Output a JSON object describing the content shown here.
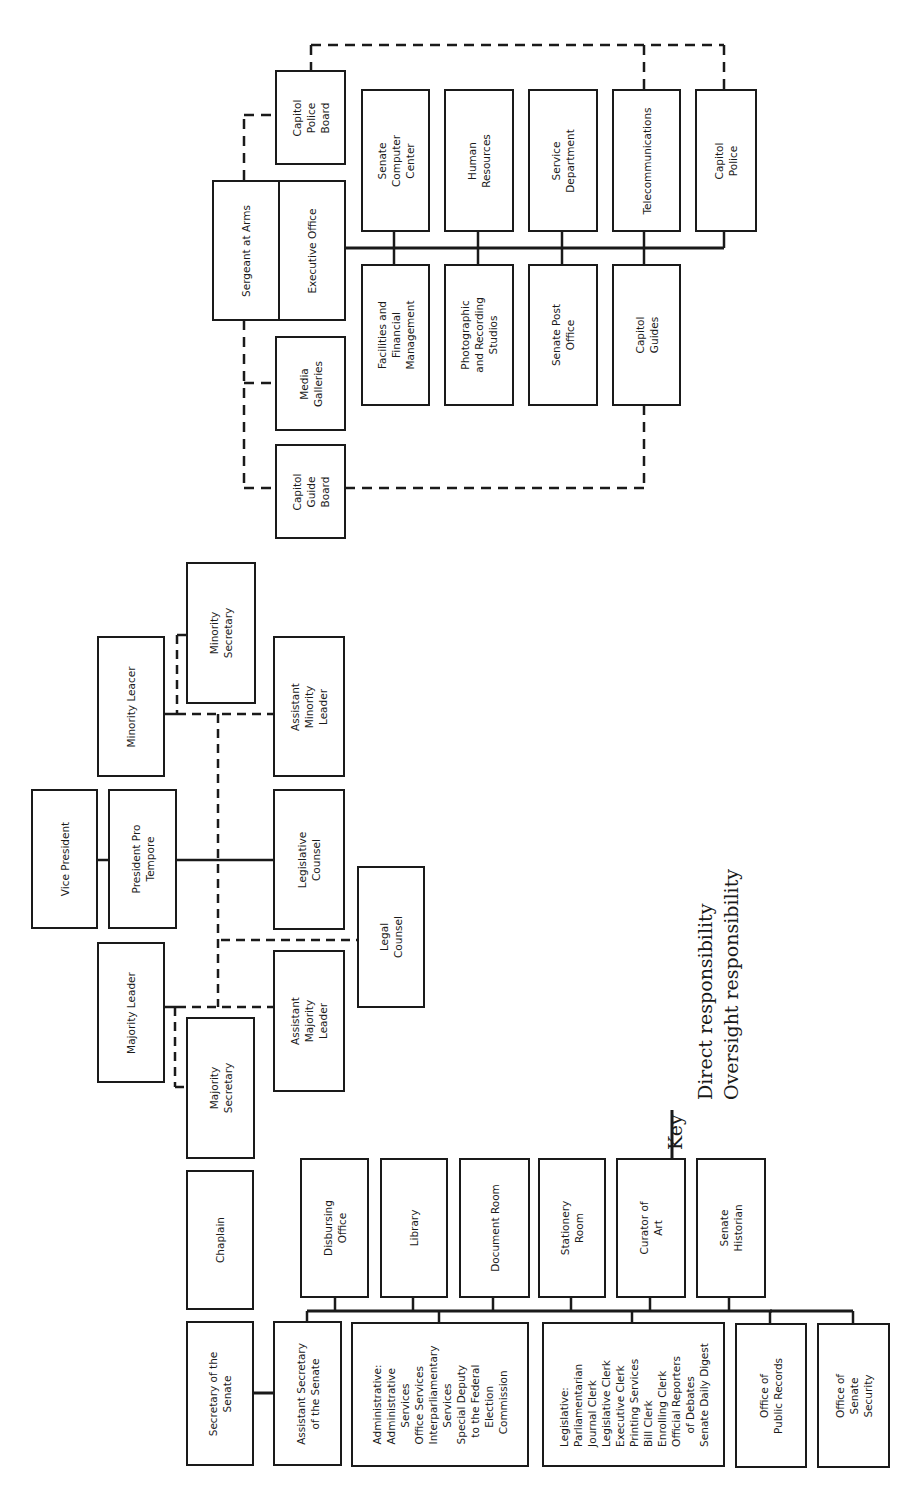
{
  "diagram": {
    "type": "org-chart",
    "orientation": "rotated-90-ccw",
    "title": "",
    "secretary_branch": {
      "head": "Secretary of the\nSenate",
      "chaplain": "Chaplain",
      "assistant": "Assistant Secretary\nof the Senate",
      "top_row": [
        "Disbursing\nOffice",
        "Library",
        "Document Room",
        "Stationery\nRoom",
        "Curator of\nArt",
        "Senate\nHistorian"
      ],
      "bottom_row": [
        "Administrative:\nAdministrative\n     Services\nOffice Services\nInterparliamentary\n     Services\nSpecial Deputy\n  to the Federal\n     Election\n   Commission",
        "Legislative:\nParliamentarian\nJournal Clerk\nLegislative Clerk\nExecutive Clerk\nPrinting Services\nBill Clerk\nEnrolling Clerk\nOfficial Reporters\n    of Debates\nSenate Daily Digest",
        "Office of\nPublic Records",
        "Office of\nSenate\nSecurity"
      ]
    },
    "leadership": {
      "vice_president": "Vice President",
      "president_pro_tempore": "President Pro\nTempore",
      "majority_leader": "Majority Leader",
      "minority_leader": "Minority Leacer",
      "majority_secretary": "Majority\nSecretary",
      "minority_secretary": "Minority\nSecretary",
      "assistant_majority_leader": "Assistant\nMajority\nLeader",
      "assistant_minority_leader": "Assistant\nMinority\nLeader",
      "legislative_counsel": "Legislative\nCounsel",
      "legal_counsel": "Legal\nCounsel"
    },
    "sergeant_branch": {
      "head": "Sergeant at Arms",
      "executive_office": "Executive Office",
      "capitol_police_board": "Capitol\nPolice\nBoard",
      "media_galleries": "Media\nGalleries",
      "capitol_guide_board": "Capitol\nGuide\nBoard",
      "top_row": [
        "Senate\nComputer\nCenter",
        "Human\nResources",
        "Service\nDepartment",
        "Telecommunications",
        "Capitol\nPolice"
      ],
      "bottom_row": [
        "Facilities and\nFinancial\nManagement",
        "Photographic\nand Recording\nStudios",
        "Senate Post\nOffice",
        "Capitol\nGuides"
      ]
    },
    "key": {
      "title": "Key",
      "direct": "Direct  responsibility",
      "oversight": "Oversight  responsibility"
    },
    "colors": {
      "line": "#1a1a1a",
      "background": "#ffffff"
    }
  }
}
